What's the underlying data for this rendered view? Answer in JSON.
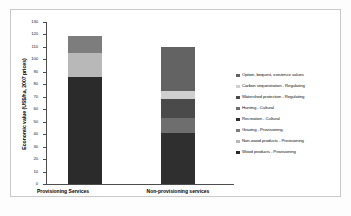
{
  "chart_data": {
    "type": "bar",
    "title": "",
    "xlabel": "",
    "ylabel": "Economic value (US$/ha, 2007 prices)",
    "ylim": [
      0,
      130
    ],
    "ytick_step": 10,
    "yticks": [
      "130",
      "120",
      "110",
      "100",
      "90",
      "80",
      "70",
      "60",
      "50",
      "40",
      "30",
      "20",
      "10",
      "0"
    ],
    "grid": false,
    "legend_position": "right",
    "stacked": true,
    "categories": [
      "Provisioning Services",
      "Non-provisioning services"
    ],
    "series": [
      {
        "name": "Wood products - Provisioning",
        "color": "#2b2b2b",
        "values": [
          86,
          0
        ]
      },
      {
        "name": "Non-wood products - Provisioning",
        "color": "#b8b8b8",
        "values": [
          19,
          0
        ]
      },
      {
        "name": "Grazing - Provisioning",
        "color": "#7d7d7d",
        "values": [
          14,
          0
        ]
      },
      {
        "name": "Recreation - Cultural",
        "color": "#2f2f2f",
        "values": [
          0,
          41
        ]
      },
      {
        "name": "Hunting - Cultural",
        "color": "#6e6e6e",
        "values": [
          0,
          12
        ]
      },
      {
        "name": "Watershed protection - Regulating",
        "color": "#4a4a4a",
        "values": [
          0,
          15
        ]
      },
      {
        "name": "Carbon sequestration - Regulating",
        "color": "#cfcfcf",
        "values": [
          0,
          7
        ]
      },
      {
        "name": "Option, bequest, existence values",
        "color": "#636363",
        "values": [
          0,
          35
        ]
      }
    ],
    "legend_entries": [
      {
        "label": "Option, bequest, existence values",
        "color": "#636363"
      },
      {
        "label": "Carbon sequestration - Regulating",
        "color": "#cfcfcf"
      },
      {
        "label": "Watershed protection - Regulating",
        "color": "#4a4a4a"
      },
      {
        "label": "Hunting - Cultural",
        "color": "#6e6e6e"
      },
      {
        "label": "Recreation - Cultural",
        "color": "#2f2f2f"
      },
      {
        "label": "Grazing - Provisioning",
        "color": "#7d7d7d"
      },
      {
        "label": "Non-wood products - Provisioning",
        "color": "#b8b8b8"
      },
      {
        "label": "Wood products - Provisioning",
        "color": "#2b2b2b"
      }
    ],
    "bar_totals": [
      119,
      110
    ],
    "bar_stacks": [
      {
        "category": "Provisioning Services",
        "segments_bottom_to_top": [
          {
            "label": "Wood products - Provisioning",
            "value": 86,
            "color": "#2b2b2b"
          },
          {
            "label": "Non-wood products - Provisioning",
            "value": 19,
            "color": "#b8b8b8"
          },
          {
            "label": "Grazing - Provisioning",
            "value": 14,
            "color": "#7d7d7d"
          }
        ]
      },
      {
        "category": "Non-provisioning services",
        "segments_bottom_to_top": [
          {
            "label": "Recreation - Cultural",
            "value": 41,
            "color": "#2f2f2f"
          },
          {
            "label": "Hunting - Cultural",
            "value": 12,
            "color": "#6e6e6e"
          },
          {
            "label": "Watershed protection - Regulating",
            "value": 15,
            "color": "#4a4a4a"
          },
          {
            "label": "Carbon sequestration - Regulating",
            "value": 7,
            "color": "#cfcfcf"
          },
          {
            "label": "Option, bequest, existence values",
            "value": 35,
            "color": "#636363"
          }
        ]
      }
    ]
  }
}
